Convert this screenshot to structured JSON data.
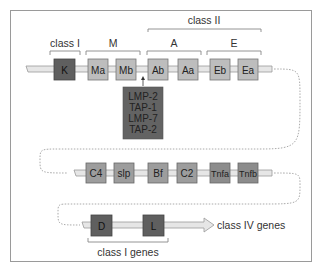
{
  "diagram": {
    "title": "",
    "colors": {
      "dark_gene": "#5f5f5f",
      "light_gene": "#bdbdbd",
      "mid_gene": "#9d9d9d",
      "chromosome": "#e6e6e6",
      "frame": "#9a9a9a",
      "text": "#333333"
    },
    "region_labels": {
      "class_I": "class I",
      "M": "M",
      "class_II": "class II",
      "A": "A",
      "E": "E",
      "class_I_genes": "class I genes",
      "class_IV_genes": "class IV genes"
    },
    "rows": [
      {
        "genes": [
          {
            "id": "K",
            "label": "K",
            "shade": "dark"
          },
          {
            "id": "Ma",
            "label": "Ma",
            "shade": "light"
          },
          {
            "id": "Mb",
            "label": "Mb",
            "shade": "light"
          },
          {
            "id": "Ab",
            "label": "Ab",
            "shade": "light"
          },
          {
            "id": "Aa",
            "label": "Aa",
            "shade": "light"
          },
          {
            "id": "Eb",
            "label": "Eb",
            "shade": "light"
          },
          {
            "id": "Ea",
            "label": "Ea",
            "shade": "light"
          }
        ]
      },
      {
        "genes": [
          {
            "id": "C4",
            "label": "C4",
            "shade": "mid"
          },
          {
            "id": "slp",
            "label": "slp",
            "shade": "mid"
          },
          {
            "id": "Bf",
            "label": "Bf",
            "shade": "mid"
          },
          {
            "id": "C2",
            "label": "C2",
            "shade": "mid"
          },
          {
            "id": "Tnfa",
            "label": "Tnfa",
            "shade": "mid"
          },
          {
            "id": "Tnfb",
            "label": "Tnfb",
            "shade": "mid"
          }
        ]
      },
      {
        "genes": [
          {
            "id": "D",
            "label": "D",
            "shade": "dark"
          },
          {
            "id": "L",
            "label": "L",
            "shade": "dark"
          }
        ]
      }
    ],
    "insert_box": {
      "lines": [
        "LMP-2",
        "TAP-1",
        "LMP-7",
        "TAP-2"
      ]
    }
  }
}
